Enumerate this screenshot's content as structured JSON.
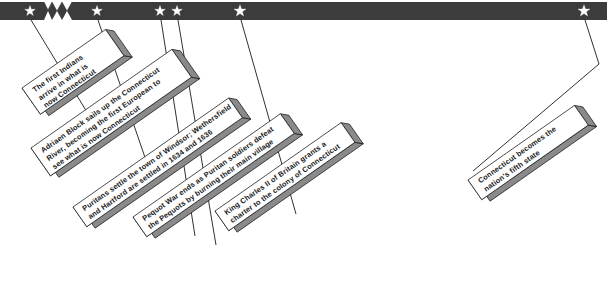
{
  "figure": {
    "type": "timeline",
    "axis_color": "#3c3c3c",
    "marker_color": "#ffffff",
    "box_fill": "#ffffff",
    "box_shadow": "#8a8a8a",
    "box_border": "#1a1a1a",
    "leader_color": "#1a1a1a",
    "break_symbol": "zigzag-time-break"
  },
  "events": [
    {
      "id": "first-indians",
      "marker_x": 30,
      "lines": [
        "The first Indians",
        "arrive in what is",
        "now Connecticut"
      ]
    },
    {
      "id": "adriaen-block",
      "marker_x": 97,
      "lines": [
        "Adriaen Block sails up the Connecticut",
        "River, becoming the first European to",
        "see what is now Connecticut"
      ]
    },
    {
      "id": "puritans-settle-windsor",
      "marker_x": 160,
      "lines": [
        "Puritans settle the town of Windsor; Wethersfield",
        "and Hartford are settled in 1634 and 1636"
      ]
    },
    {
      "id": "pequot-war-ends",
      "marker_x": 177,
      "lines": [
        "Pequot War ends as Puritan soldiers defeat",
        "the Pequots by burning their main village"
      ]
    },
    {
      "id": "royal-charter",
      "marker_x": 240,
      "lines": [
        "King Charles II of Britain grants a",
        "charter to the colony of Connecticut"
      ]
    },
    {
      "id": "fifth-state",
      "marker_x": 584,
      "lines": [
        "Connecticut becomes the",
        "nation's fifth state"
      ]
    }
  ]
}
